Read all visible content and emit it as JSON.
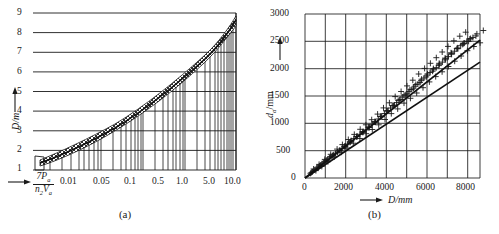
{
  "figure": {
    "panels": [
      {
        "id": "a",
        "caption": "(a)",
        "chart_data": {
          "type": "line",
          "title": "",
          "xlabel": "7Pₐ / n₂Vₐ",
          "xlabel_numerator": "7P",
          "xlabel_numerator_sub": "a",
          "xlabel_denominator": "n",
          "xlabel_denominator_sub1": "2",
          "xlabel_denominator_var": "V",
          "xlabel_denominator_sub2": "a",
          "ylabel": "D/m",
          "xscale": "log",
          "xlim": [
            0.003,
            10.0
          ],
          "ylim": [
            1,
            9
          ],
          "grid": true,
          "legend": "none",
          "xticks": [
            0.01,
            0.05,
            0.1,
            0.5,
            1.0,
            5.0,
            10.0
          ],
          "xtick_labels": [
            "0.01",
            "0.05",
            "0.1",
            "0.5",
            "1.0",
            "5.0",
            "10.0"
          ],
          "yticks": [
            1,
            2,
            3,
            4,
            5,
            6,
            7,
            8,
            9
          ],
          "ytick_labels": [
            "1",
            "2",
            "3",
            "4",
            "5",
            "6",
            "7",
            "8",
            "9"
          ],
          "series": [
            {
              "name": "D vs 7Pa/n2Va (central curve)",
              "x": [
                0.004,
                0.006,
                0.01,
                0.02,
                0.03,
                0.05,
                0.08,
                0.1,
                0.2,
                0.3,
                0.5,
                0.8,
                1.0,
                2.0,
                3.0,
                5.0,
                8.0,
                10.0
              ],
              "y": [
                1.35,
                1.5,
                1.7,
                2.05,
                2.3,
                2.7,
                3.1,
                3.3,
                4.0,
                4.45,
                5.1,
                5.7,
                6.0,
                6.95,
                7.5,
                8.2,
                8.8,
                9.0
              ]
            },
            {
              "name": "upper band bound",
              "x": [
                0.004,
                0.01,
                0.03,
                0.1,
                0.3,
                1.0,
                3.0,
                10.0
              ],
              "y": [
                1.45,
                1.85,
                2.5,
                3.55,
                4.7,
                6.3,
                7.8,
                9.3
              ]
            },
            {
              "name": "lower band bound",
              "x": [
                0.004,
                0.01,
                0.03,
                0.1,
                0.3,
                1.0,
                3.0,
                10.0
              ],
              "y": [
                1.25,
                1.55,
                2.1,
                3.05,
                4.2,
                5.7,
                7.2,
                8.7
              ]
            }
          ],
          "annotations": [
            {
              "text": "scatter band (cross-hatched)",
              "kind": "band"
            }
          ]
        }
      },
      {
        "id": "b",
        "caption": "(b)",
        "chart_data": {
          "type": "scatter",
          "title": "",
          "xlabel": "D/mm",
          "ylabel": "dₐ/mm",
          "ylabel_var": "d",
          "ylabel_sub": "a",
          "ylabel_unit": "/mm",
          "xscale": "linear",
          "xlim": [
            0,
            8600
          ],
          "ylim": [
            0,
            3000
          ],
          "grid": true,
          "legend": "none",
          "xticks": [
            0,
            2000,
            4000,
            6000,
            8000
          ],
          "xtick_labels": [
            "0",
            "2000",
            "4000",
            "6000",
            "8000"
          ],
          "yticks": [
            0,
            500,
            1000,
            1500,
            2000,
            2500,
            3000
          ],
          "ytick_labels": [
            "0",
            "500",
            "1000",
            "1500",
            "2000",
            "2500",
            "3000"
          ],
          "series": [
            {
              "name": "upper regression line",
              "type": "line",
              "x": [
                0,
                8600
              ],
              "y": [
                0,
                2520
              ]
            },
            {
              "name": "lower regression line",
              "type": "line",
              "x": [
                0,
                8600
              ],
              "y": [
                0,
                2120
              ]
            },
            {
              "name": "measured points (cross markers)",
              "type": "scatter",
              "x": [
                320,
                480,
                640,
                760,
                900,
                1050,
                1200,
                1350,
                1500,
                1680,
                1820,
                1950,
                2100,
                2250,
                2400,
                2560,
                2700,
                2860,
                3000,
                3150,
                3300,
                3450,
                3600,
                3750,
                3900,
                4050,
                4200,
                4350,
                4500,
                4650,
                4800,
                4950,
                5100,
                5250,
                5400,
                5550,
                5700,
                5850,
                6000,
                6150,
                6300,
                6450,
                6600,
                6750,
                6900,
                7050,
                7200,
                7350,
                7500,
                7650,
                7800,
                7950,
                8100,
                8250,
                8400
              ],
              "y": [
                100,
                150,
                200,
                230,
                280,
                320,
                370,
                410,
                450,
                500,
                540,
                580,
                620,
                670,
                720,
                760,
                800,
                850,
                880,
                930,
                980,
                1020,
                1080,
                1120,
                1180,
                1230,
                1280,
                1320,
                1380,
                1430,
                1480,
                1520,
                1580,
                1620,
                1680,
                1720,
                1780,
                1830,
                1880,
                1930,
                1980,
                2020,
                2080,
                2120,
                2180,
                2220,
                2280,
                2320,
                2380,
                2420,
                2460,
                2500,
                2540,
                2570,
                2600
              ]
            }
          ]
        }
      }
    ]
  }
}
